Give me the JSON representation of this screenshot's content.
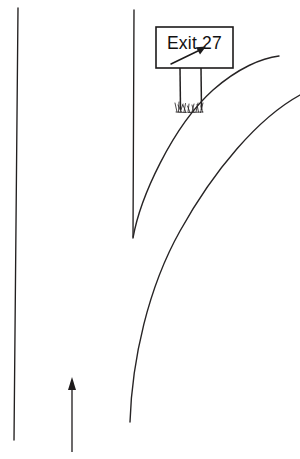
{
  "diagram": {
    "background_color": "#ffffff",
    "line_color": "#221f1f",
    "width": 300,
    "height": 459
  },
  "sign": {
    "label": "Exit 27",
    "exit_number": "27",
    "box": {
      "x": 156,
      "y": 27,
      "width": 77,
      "height": 41
    },
    "fill_color": "#ffffff",
    "border_color": "#1c1a1a",
    "arrow_name": "diagonal-up-right-arrow",
    "posts": [
      {
        "x": 180,
        "top": 68,
        "bottom": 110
      },
      {
        "x": 201,
        "top": 68,
        "bottom": 110
      }
    ]
  },
  "roads": {
    "left_edge": {
      "name": "left-road-edge",
      "path": "M 18 8 L 14 440"
    },
    "median": {
      "name": "center-median-line",
      "path": "M 134 10 L 133 237"
    },
    "ramp_inner": {
      "name": "exit-ramp-inner-curve",
      "path": "M 133 238 C 140 198 172 127 213 90 C 238 68 262 58 279 56"
    },
    "ramp_outer": {
      "name": "exit-ramp-outer-curve",
      "path": "M 130 422 C 132 360 148 288 180 231 C 214 170 258 118 300 95"
    }
  },
  "direction_arrow": {
    "name": "travel-direction-arrow",
    "x": 72,
    "tail_y": 452,
    "head_y": 378,
    "points": "up"
  },
  "grass": {
    "name": "grass-tuft",
    "center_x": 190,
    "base_y": 112,
    "blade_count": 13
  }
}
